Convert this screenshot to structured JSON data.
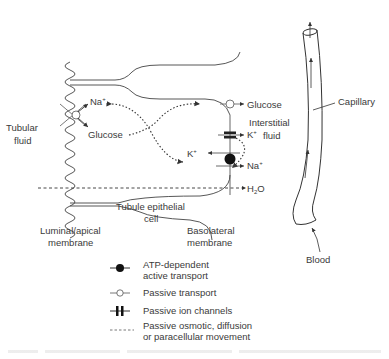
{
  "diagram": {
    "regions": {
      "tubular_fluid": [
        "Tubular",
        "fluid"
      ],
      "interstitial_fluid": [
        "Interstitial",
        "fluid"
      ],
      "cell": [
        "Tubule epithelial",
        "cell"
      ],
      "luminal_membrane": [
        "Luminal/apical",
        "membrane"
      ],
      "basolateral_membrane": [
        "Basolateral",
        "membrane"
      ],
      "capillary": "Capillary",
      "blood": "Blood"
    },
    "solutes": {
      "apical_na": "Na",
      "apical_na_sup": "+",
      "apical_glucose": "Glucose",
      "baso_glucose": "Glucose",
      "baso_k_out": "K",
      "baso_k_out_sup": "+",
      "baso_k_in": "K",
      "baso_k_in_sup": "+",
      "baso_na": "Na",
      "baso_na_sup": "+",
      "water": "H",
      "water_sub": "2",
      "water_o": "O"
    },
    "legend": [
      {
        "symbol": "filled-circle",
        "lines": [
          "ATP-dependent",
          "active transport"
        ]
      },
      {
        "symbol": "open-circle",
        "lines": [
          "Passive transport"
        ]
      },
      {
        "symbol": "ion-channel",
        "lines": [
          "Passive ion channels"
        ]
      },
      {
        "symbol": "dashed-line",
        "lines": [
          "Passive osmotic, diffusion",
          "or paracellular movement"
        ]
      }
    ]
  }
}
